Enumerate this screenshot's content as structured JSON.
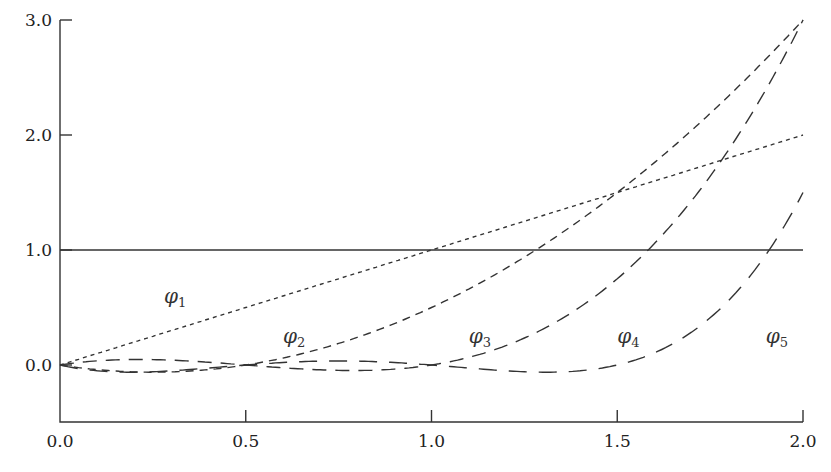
{
  "chart_data": {
    "type": "line",
    "title": "",
    "xlabel": "",
    "ylabel": "",
    "xlim": [
      0.0,
      2.0
    ],
    "ylim": [
      -0.5,
      3.0
    ],
    "grid": false,
    "legend": "none (inline curve labels)",
    "x_ticks": [
      "0.0",
      "0.5",
      "1.0",
      "1.5",
      "2.0"
    ],
    "y_ticks": [
      "0.0",
      "1.0",
      "2.0",
      "3.0"
    ],
    "x": [
      0.0,
      0.25,
      0.5,
      0.75,
      1.0,
      1.25,
      1.5,
      1.75,
      2.0
    ],
    "series": [
      {
        "name": "φ1",
        "label": "φ",
        "sub": "1",
        "dash": "solid",
        "values": [
          1,
          1,
          1,
          1,
          1,
          1,
          1,
          1,
          1
        ]
      },
      {
        "name": "φ2",
        "label": "φ",
        "sub": "2",
        "dash": "4,4",
        "values": [
          0,
          0.25,
          0.5,
          0.75,
          1.0,
          1.25,
          1.5,
          1.75,
          2.0
        ]
      },
      {
        "name": "φ3",
        "label": "φ",
        "sub": "3",
        "dash": "8,6",
        "values": [
          0,
          -0.0625,
          0,
          0.1875,
          0.5,
          0.9375,
          1.5,
          2.1875,
          3.0
        ]
      },
      {
        "name": "φ4",
        "label": "φ",
        "sub": "4",
        "dash": "14,9",
        "values": [
          0,
          0.047,
          0,
          -0.047,
          0,
          0.234,
          0.75,
          1.64,
          3.0
        ]
      },
      {
        "name": "φ5",
        "label": "φ",
        "sub": "5",
        "dash": "18,12",
        "values": [
          0,
          -0.059,
          0,
          0.035,
          0,
          -0.059,
          0,
          0.41,
          1.5
        ]
      }
    ],
    "annotations": [
      {
        "text": "φ1",
        "x": 0.28,
        "y": 0.6
      },
      {
        "text": "φ2",
        "x": 0.6,
        "y": 0.25
      },
      {
        "text": "φ3",
        "x": 1.1,
        "y": 0.25
      },
      {
        "text": "φ4",
        "x": 1.5,
        "y": 0.25
      },
      {
        "text": "φ5",
        "x": 1.9,
        "y": 0.25
      }
    ]
  }
}
